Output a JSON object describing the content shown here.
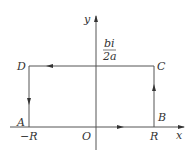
{
  "diagram": {
    "type": "contour-integration-rectangle",
    "axes": {
      "x_label": "x",
      "y_label": "y",
      "origin_label": "O"
    },
    "vertices": {
      "A": {
        "label": "A",
        "position": "(-R, 0)"
      },
      "B": {
        "label": "B",
        "position": "(R, 0)"
      },
      "C": {
        "label": "C",
        "position": "(R, bi/2a)"
      },
      "D": {
        "label": "D",
        "position": "(-R, bi/2a)"
      }
    },
    "tick_labels": {
      "neg_R": "−R",
      "pos_R": "R"
    },
    "height_label": {
      "numerator": "bi",
      "denominator": "2a"
    },
    "path_direction": [
      "A→B",
      "B→C",
      "C→D",
      "D→A"
    ],
    "colors": {
      "line": "#555555",
      "text": "#333333"
    }
  }
}
